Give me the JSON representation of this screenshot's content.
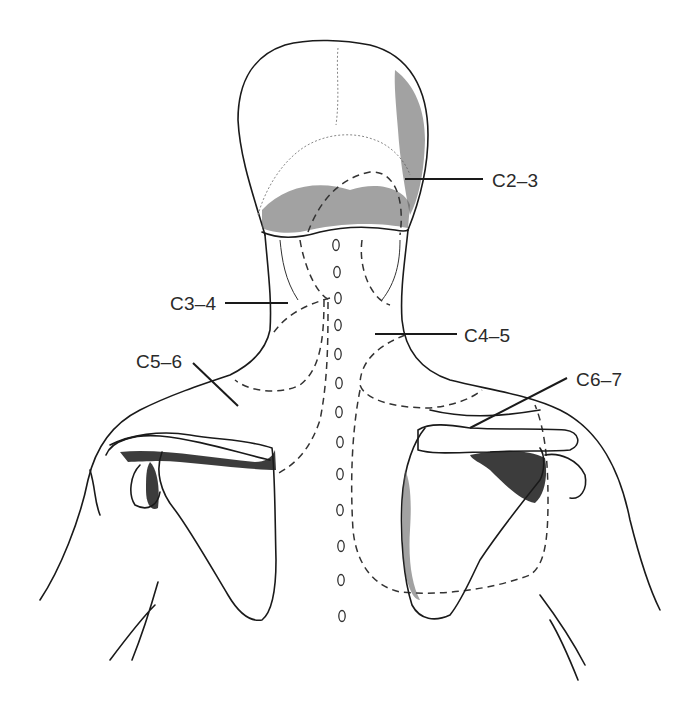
{
  "figure": {
    "labels": [
      {
        "id": "c2-3",
        "text": "C2–3",
        "x": 492,
        "y": 170
      },
      {
        "id": "c3-4",
        "text": "C3–4",
        "x": 170,
        "y": 294
      },
      {
        "id": "c4-5",
        "text": "C4–5",
        "x": 464,
        "y": 327
      },
      {
        "id": "c5-6",
        "text": "C5–6",
        "x": 136,
        "y": 353
      },
      {
        "id": "c6-7",
        "text": "C6–7",
        "x": 576,
        "y": 370
      }
    ],
    "spinous_processes_count": 14
  }
}
